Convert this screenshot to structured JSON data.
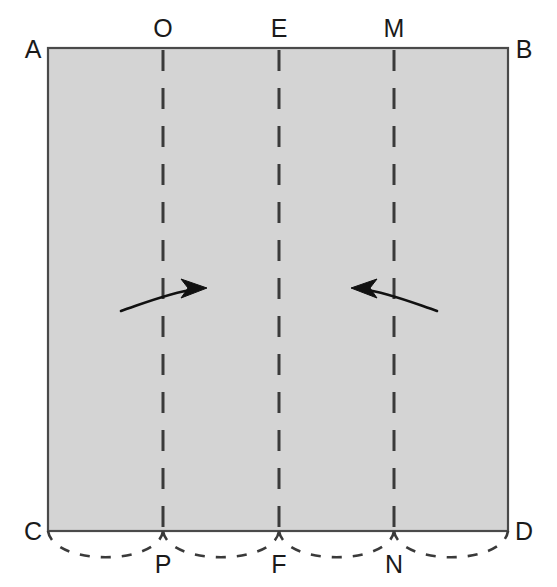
{
  "figure": {
    "sheet": {
      "name": "paper-sheet",
      "fill_color": "#d4d4d4",
      "stroke_color": "#4a4a4a",
      "left": 48,
      "right": 508,
      "top": 48,
      "bottom": 531,
      "width": 460,
      "height": 483
    },
    "corner_labels": {
      "top_left": "A",
      "top_right": "B",
      "bottom_left": "C",
      "bottom_right": "D"
    },
    "top_labels": {
      "first": "O",
      "second": "E",
      "third": "M"
    },
    "bottom_labels": {
      "first": "P",
      "second": "F",
      "third": "N"
    },
    "fold_lines": [
      {
        "id": "fold-line-OP",
        "top_label": "O",
        "bottom_label": "P",
        "x": 163,
        "style": "dashed"
      },
      {
        "id": "fold-line-EF",
        "top_label": "E",
        "bottom_label": "F",
        "x": 279,
        "style": "dashed"
      },
      {
        "id": "fold-line-MN",
        "top_label": "M",
        "bottom_label": "N",
        "x": 394,
        "style": "dashed"
      }
    ],
    "arrows": [
      {
        "id": "arrow-left-fold",
        "direction": "right",
        "tail_x": 121,
        "tail_y": 311,
        "tip_x": 202,
        "tip_y": 288
      },
      {
        "id": "arrow-right-fold",
        "direction": "left",
        "tail_x": 437,
        "tail_y": 311,
        "tip_x": 352,
        "tip_y": 288
      }
    ],
    "bottom_arcs": [
      {
        "id": "arc-C-P",
        "from": "C",
        "to": "P",
        "start_x": 48,
        "end_x": 163
      },
      {
        "id": "arc-P-F",
        "from": "P",
        "to": "F",
        "start_x": 163,
        "end_x": 279
      },
      {
        "id": "arc-F-N",
        "from": "F",
        "to": "N",
        "start_x": 279,
        "end_x": 394
      },
      {
        "id": "arc-N-D",
        "from": "N",
        "to": "D",
        "start_x": 394,
        "end_x": 508
      }
    ],
    "colors": {
      "sheet_fill": "#d4d4d4",
      "outline": "#4a4a4a",
      "dash": "#3a3a3a",
      "arrow": "#111111",
      "label": "#1a1a1a",
      "background": "#ffffff"
    }
  }
}
